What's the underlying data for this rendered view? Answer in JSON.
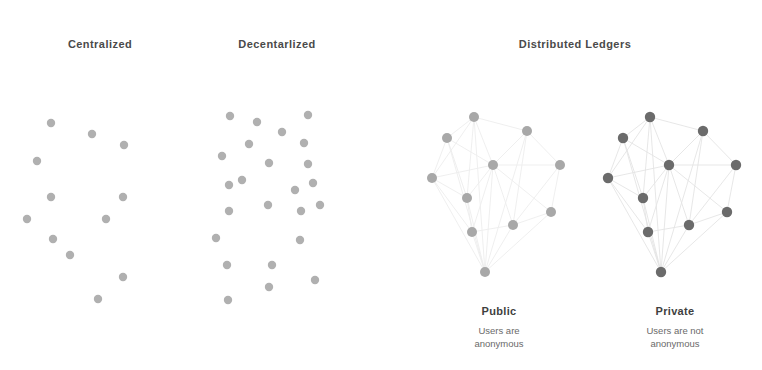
{
  "canvas": {
    "width": 762,
    "height": 370,
    "background": "#ffffff"
  },
  "colors": {
    "heading_text": "#4a4a4a",
    "sub_heading_text": "#3f3f3f",
    "caption_text": "#6a6a6a",
    "node_light": "#b0b0b0",
    "node_public": "#a8a8a8",
    "node_private": "#6b6b6b",
    "edge_light": "#ebebeb",
    "edge_private": "#e2e2e2"
  },
  "headings": [
    {
      "id": "centralized",
      "label": "Centralized",
      "x": 100,
      "y": 38
    },
    {
      "id": "decentralized",
      "label": "Decentarlized",
      "x": 277,
      "y": 38
    },
    {
      "id": "distributed-ledgers",
      "label": "Distributed Ledgers",
      "x": 575,
      "y": 38
    }
  ],
  "sub_panels": [
    {
      "id": "public",
      "label": "Public",
      "caption": "Users are\nanonymous",
      "label_x": 499,
      "label_y": 305,
      "caption_x": 499,
      "caption_y": 325
    },
    {
      "id": "private",
      "label": "Private",
      "caption": "Users are not\nanonymous",
      "label_x": 675,
      "label_y": 305,
      "caption_x": 675,
      "caption_y": 325
    }
  ],
  "clusters": [
    {
      "id": "centralized-network",
      "name": "centralized-node-cluster",
      "node_color": "#b0b0b0",
      "node_radius": 4.2,
      "edge_color": "#f2f2f2",
      "edges": [],
      "nodes": [
        [
          51,
          123
        ],
        [
          92,
          134
        ],
        [
          124,
          145
        ],
        [
          37,
          161
        ],
        [
          51,
          197
        ],
        [
          123,
          197
        ],
        [
          27,
          219
        ],
        [
          106,
          219
        ],
        [
          53,
          239
        ],
        [
          70,
          255
        ],
        [
          123,
          277
        ],
        [
          98,
          299
        ]
      ]
    },
    {
      "id": "decentralized-network",
      "name": "decentralized-node-cluster",
      "node_color": "#b0b0b0",
      "node_radius": 4.2,
      "edge_color": "#f4f4f4",
      "edges": [],
      "nodes": [
        [
          230,
          116
        ],
        [
          257,
          122
        ],
        [
          308,
          115
        ],
        [
          282,
          132
        ],
        [
          249,
          144
        ],
        [
          304,
          143
        ],
        [
          222,
          156
        ],
        [
          269,
          163
        ],
        [
          308,
          164
        ],
        [
          242,
          180
        ],
        [
          229,
          185
        ],
        [
          295,
          190
        ],
        [
          313,
          183
        ],
        [
          229,
          211
        ],
        [
          268,
          205
        ],
        [
          301,
          211
        ],
        [
          320,
          205
        ],
        [
          216,
          238
        ],
        [
          300,
          240
        ],
        [
          227,
          265
        ],
        [
          272,
          265
        ],
        [
          315,
          280
        ],
        [
          269,
          287
        ],
        [
          228,
          300
        ]
      ]
    },
    {
      "id": "public-ledger-network",
      "name": "public-node-cluster",
      "node_color": "#a8a8a8",
      "node_radius": 5.0,
      "edge_color": "#ededed",
      "nodes": [
        [
          474,
          117
        ],
        [
          447,
          138
        ],
        [
          527,
          131
        ],
        [
          493,
          165
        ],
        [
          560,
          165
        ],
        [
          432,
          178
        ],
        [
          467,
          198
        ],
        [
          551,
          212
        ],
        [
          513,
          225
        ],
        [
          472,
          232
        ],
        [
          485,
          272
        ]
      ],
      "edges": [
        [
          0,
          1
        ],
        [
          0,
          3
        ],
        [
          0,
          2
        ],
        [
          0,
          5
        ],
        [
          0,
          6
        ],
        [
          0,
          10
        ],
        [
          1,
          3
        ],
        [
          1,
          5
        ],
        [
          1,
          6
        ],
        [
          1,
          10
        ],
        [
          2,
          3
        ],
        [
          2,
          4
        ],
        [
          2,
          8
        ],
        [
          2,
          10
        ],
        [
          3,
          4
        ],
        [
          3,
          5
        ],
        [
          3,
          6
        ],
        [
          3,
          7
        ],
        [
          3,
          8
        ],
        [
          3,
          9
        ],
        [
          3,
          10
        ],
        [
          4,
          7
        ],
        [
          4,
          8
        ],
        [
          5,
          6
        ],
        [
          5,
          9
        ],
        [
          5,
          10
        ],
        [
          6,
          9
        ],
        [
          6,
          10
        ],
        [
          7,
          8
        ],
        [
          7,
          10
        ],
        [
          8,
          9
        ],
        [
          8,
          10
        ],
        [
          9,
          10
        ]
      ]
    },
    {
      "id": "private-ledger-network",
      "name": "private-node-cluster",
      "node_color": "#6b6b6b",
      "node_radius": 5.2,
      "edge_color": "#e4e4e4",
      "nodes": [
        [
          650,
          117
        ],
        [
          623,
          138
        ],
        [
          703,
          131
        ],
        [
          669,
          165
        ],
        [
          736,
          165
        ],
        [
          608,
          178
        ],
        [
          643,
          198
        ],
        [
          727,
          212
        ],
        [
          689,
          225
        ],
        [
          648,
          232
        ],
        [
          661,
          272
        ]
      ],
      "edges": [
        [
          0,
          1
        ],
        [
          0,
          3
        ],
        [
          0,
          2
        ],
        [
          0,
          5
        ],
        [
          0,
          6
        ],
        [
          0,
          10
        ],
        [
          1,
          3
        ],
        [
          1,
          5
        ],
        [
          1,
          6
        ],
        [
          1,
          10
        ],
        [
          2,
          3
        ],
        [
          2,
          4
        ],
        [
          2,
          8
        ],
        [
          2,
          10
        ],
        [
          3,
          4
        ],
        [
          3,
          5
        ],
        [
          3,
          6
        ],
        [
          3,
          7
        ],
        [
          3,
          8
        ],
        [
          3,
          9
        ],
        [
          3,
          10
        ],
        [
          4,
          7
        ],
        [
          4,
          8
        ],
        [
          5,
          6
        ],
        [
          5,
          9
        ],
        [
          5,
          10
        ],
        [
          6,
          9
        ],
        [
          6,
          10
        ],
        [
          7,
          8
        ],
        [
          7,
          10
        ],
        [
          8,
          9
        ],
        [
          8,
          10
        ],
        [
          9,
          10
        ]
      ]
    }
  ]
}
